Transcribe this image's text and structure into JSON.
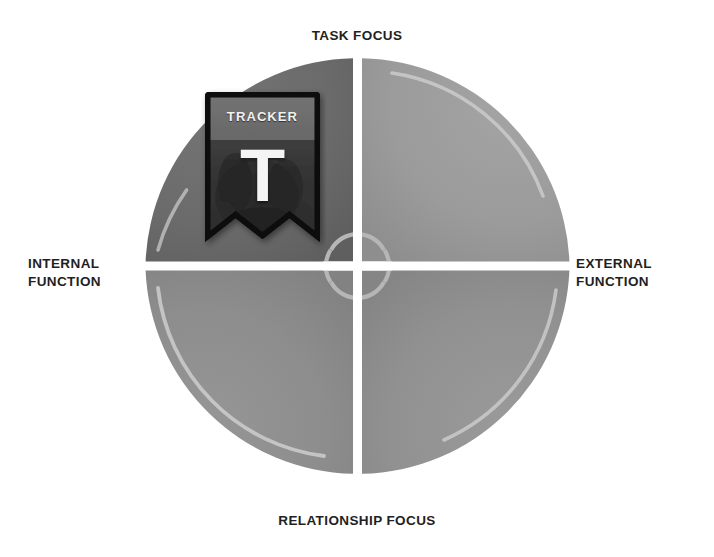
{
  "diagram": {
    "type": "quadrant-wheel",
    "title_visible": false,
    "axes": {
      "top_label": "TASK FOCUS",
      "bottom_label": "RELATIONSHIP FOCUS",
      "left_label": "INTERNAL\nFUNCTION",
      "right_label": "EXTERNAL\nFUNCTION"
    },
    "center_marker": "crosshair-reticle",
    "quadrants": [
      {
        "id": "top-left",
        "position": "internal-task",
        "color": "#6a6a6a",
        "highlighted": true
      },
      {
        "id": "top-right",
        "position": "external-task",
        "color": "#9c9c9c",
        "highlighted": false
      },
      {
        "id": "bottom-left",
        "position": "internal-relationship",
        "color": "#8e8e8e",
        "highlighted": false
      },
      {
        "id": "bottom-right",
        "position": "external-relationship",
        "color": "#929292",
        "highlighted": false
      }
    ],
    "badge": {
      "title": "TRACKER",
      "letter": "T",
      "quadrant": "top-left",
      "shape": "ribbon-banner"
    },
    "colors": {
      "background": "#ffffff",
      "label_text": "#231f20",
      "divider": "#ffffff",
      "badge_border": "#000000",
      "badge_fill": "#3a3a3a",
      "badge_band": "#6d6d6d",
      "badge_text": "#f2f2f2",
      "reticle": "#b8b8b8",
      "rim_highlight": "#c3c3c3"
    }
  }
}
